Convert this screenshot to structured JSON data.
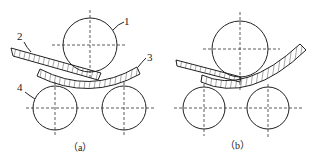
{
  "figure": {
    "panels": [
      {
        "id": "a",
        "caption": "（a）",
        "labels": {
          "top_roller": "1",
          "plate": "2",
          "bent_plate": "3",
          "bottom_roller": "4"
        }
      },
      {
        "id": "b",
        "caption": "（b）"
      }
    ],
    "colors": {
      "line": "#222222",
      "background": "#ffffff"
    }
  }
}
